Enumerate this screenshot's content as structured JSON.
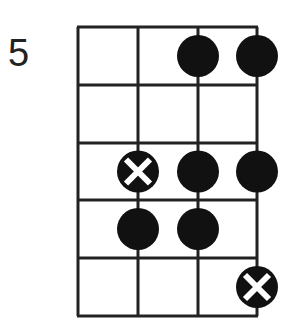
{
  "diagram": {
    "type": "fretboard-chord-box",
    "fret_label": "5",
    "strings": 4,
    "frets": 5,
    "colors": {
      "line": "#222222",
      "dot": "#111111",
      "mark": "#ffffff",
      "background": "#ffffff"
    },
    "dots": [
      {
        "fret": 1,
        "string": 3,
        "kind": "filled"
      },
      {
        "fret": 1,
        "string": 4,
        "kind": "filled"
      },
      {
        "fret": 3,
        "string": 2,
        "kind": "root-x"
      },
      {
        "fret": 3,
        "string": 3,
        "kind": "filled"
      },
      {
        "fret": 3,
        "string": 4,
        "kind": "filled"
      },
      {
        "fret": 4,
        "string": 2,
        "kind": "filled"
      },
      {
        "fret": 4,
        "string": 3,
        "kind": "filled"
      },
      {
        "fret": 5,
        "string": 4,
        "kind": "root-x"
      }
    ]
  }
}
